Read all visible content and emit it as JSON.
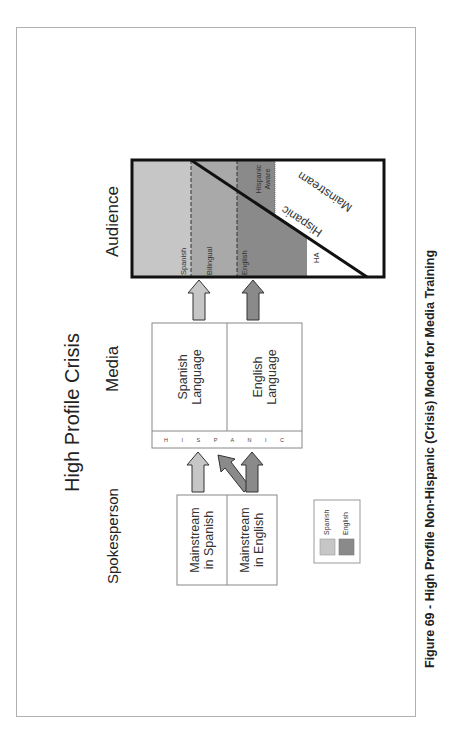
{
  "figure": {
    "title": "High Profile Crisis",
    "caption": "Figure 69 - High Profile Non-Hispanic (Crisis) Model for Media Training"
  },
  "sections": {
    "spokesperson": "Spokesperson",
    "media": "Media",
    "audience": "Audience"
  },
  "spokesperson_boxes": [
    {
      "line1": "Mainstream",
      "line2": "in Spanish"
    },
    {
      "line1": "Mainstream",
      "line2": "in English"
    }
  ],
  "media_boxes": [
    {
      "line1": "Spanish",
      "line2": "Language"
    },
    {
      "line1": "English",
      "line2": "Language"
    }
  ],
  "hispanic_strip": "H I S P A N I C",
  "audience_segments": {
    "spanish": "Spanish",
    "bilingual": "Bilingual",
    "english": "English",
    "hispanic_aware_1": "Hispanic",
    "hispanic_aware_2": "Aware",
    "hispanic": "Hispanic",
    "mainstream": "Mainstream",
    "ha": "HA"
  },
  "legend": [
    {
      "label": "Spanish",
      "color": "#c6c6c6"
    },
    {
      "label": "English",
      "color": "#8a8a8a"
    }
  ],
  "colors": {
    "spanish": "#c6c6c6",
    "bilingual": "#a9a9a9",
    "english": "#8a8a8a",
    "outline": "#111111"
  }
}
